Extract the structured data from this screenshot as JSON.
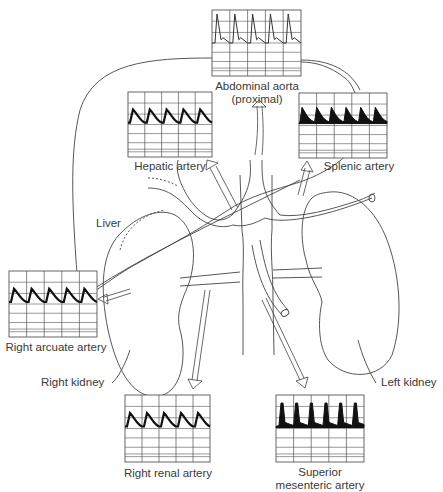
{
  "diagram": {
    "organs": {
      "liver": "Liver",
      "right_kidney": "Right kidney",
      "left_kidney": "Left kidney"
    },
    "waveforms": [
      {
        "id": "abdominal-aorta",
        "label_line1": "Abdominal aorta",
        "label_line2": "(proximal)",
        "box": [
          212,
          10,
          89,
          66
        ],
        "cycles": 5,
        "style": "high-resistance-line"
      },
      {
        "id": "hepatic-artery",
        "label_line1": "Hepatic artery",
        "label_line2": "",
        "box": [
          128,
          92,
          84,
          65
        ],
        "cycles": 5,
        "style": "low-resistance-thick"
      },
      {
        "id": "splenic-artery",
        "label_line1": "Splenic artery",
        "label_line2": "",
        "box": [
          299,
          93,
          88,
          65
        ],
        "cycles": 6,
        "style": "low-resistance-filled"
      },
      {
        "id": "right-arcuate-artery",
        "label_line1": "Right arcuate artery",
        "label_line2": "",
        "box": [
          9,
          271,
          88,
          66
        ],
        "cycles": 5,
        "style": "low-resistance-thick"
      },
      {
        "id": "right-renal-artery",
        "label_line1": "Right renal artery",
        "label_line2": "",
        "box": [
          125,
          395,
          85,
          67
        ],
        "cycles": 5,
        "style": "low-resistance-thick"
      },
      {
        "id": "superior-mesenteric-artery",
        "label_line1": "Superior",
        "label_line2": "mesenteric artery",
        "box": [
          276,
          395,
          88,
          67
        ],
        "cycles": 6,
        "style": "high-resistance-filled"
      }
    ],
    "colors": {
      "line": "#333333",
      "grid": "#555555",
      "fill": "#111111",
      "text": "#3a3a3a"
    }
  }
}
